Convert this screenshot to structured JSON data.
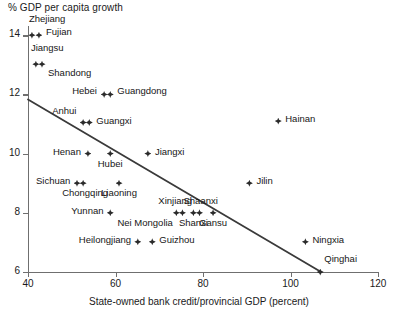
{
  "chart_data": {
    "type": "scatter",
    "title": "% GDP per capita growth",
    "ylabel": "% GDP per capita growth",
    "xlabel": "State-owned bank credit/provincial GDP (percent)",
    "xlim": [
      40,
      120
    ],
    "ylim": [
      6,
      14.4
    ],
    "xticks": [
      40,
      60,
      80,
      100,
      120
    ],
    "yticks": [
      6,
      8,
      10,
      12,
      14
    ],
    "grid": false,
    "legend": "none",
    "trend_line": {
      "x": [
        40,
        107
      ],
      "y": [
        11.83,
        6.0
      ]
    },
    "points": [
      {
        "name": "Zhejiang",
        "x": 40.9,
        "y": 14.0,
        "label_dx": -3,
        "label_dy": -17,
        "label_anchor": "left"
      },
      {
        "name": "Fujian",
        "x": 42.5,
        "y": 14.0,
        "label_dx": 7,
        "label_dy": -4,
        "label_anchor": "left"
      },
      {
        "name": "Jiangsu",
        "x": 41.8,
        "y": 13.02,
        "label_dx": -5,
        "label_dy": -17,
        "label_anchor": "left"
      },
      {
        "name": "Shandong",
        "x": 43.2,
        "y": 13.02,
        "label_dx": 6,
        "label_dy": 8,
        "label_anchor": "left"
      },
      {
        "name": "Hebei",
        "x": 57.4,
        "y": 12.0,
        "label_dx": -7,
        "label_dy": -4,
        "label_anchor": "right"
      },
      {
        "name": "Guangdong",
        "x": 58.8,
        "y": 12.0,
        "label_dx": 7,
        "label_dy": -4,
        "label_anchor": "left"
      },
      {
        "name": "Anhui",
        "x": 52.6,
        "y": 11.05,
        "label_dx": -7,
        "label_dy": -13,
        "label_anchor": "right"
      },
      {
        "name": "Guangxi",
        "x": 54.0,
        "y": 11.05,
        "label_dx": 7,
        "label_dy": -3,
        "label_anchor": "left"
      },
      {
        "name": "Hainan",
        "x": 97.2,
        "y": 11.1,
        "label_dx": 7,
        "label_dy": -3,
        "label_anchor": "left"
      },
      {
        "name": "Henan",
        "x": 53.7,
        "y": 10.0,
        "label_dx": -7,
        "label_dy": -3,
        "label_anchor": "right"
      },
      {
        "name": "Hubei",
        "x": 58.8,
        "y": 10.0,
        "label_dx": 0,
        "label_dy": 9,
        "label_anchor": "center"
      },
      {
        "name": "Jiangxi",
        "x": 67.4,
        "y": 10.0,
        "label_dx": 7,
        "label_dy": -3,
        "label_anchor": "left"
      },
      {
        "name": "Sichuan",
        "x": 51.2,
        "y": 9.0,
        "label_dx": -7,
        "label_dy": -3,
        "label_anchor": "right"
      },
      {
        "name": "Chongqing",
        "x": 52.6,
        "y": 9.0,
        "label_dx": 2,
        "label_dy": 9,
        "label_anchor": "center"
      },
      {
        "name": "Liaoning",
        "x": 60.8,
        "y": 9.0,
        "label_dx": 0,
        "label_dy": 9,
        "label_anchor": "center"
      },
      {
        "name": "Jilin",
        "x": 90.6,
        "y": 9.0,
        "label_dx": 7,
        "label_dy": -3,
        "label_anchor": "left"
      },
      {
        "name": "Yunnan",
        "x": 58.8,
        "y": 8.0,
        "label_dx": -7,
        "label_dy": -3,
        "label_anchor": "right"
      },
      {
        "name": "Xinjiang",
        "x": 73.9,
        "y": 8.0,
        "label_dx": -1,
        "label_dy": -13,
        "label_anchor": "center"
      },
      {
        "name": "Nei Mongolia",
        "x": 75.3,
        "y": 8.0,
        "label_dx": -10,
        "label_dy": 9,
        "label_anchor": "right"
      },
      {
        "name": "Shanxi",
        "x": 77.8,
        "y": 8.0,
        "label_dx": 0,
        "label_dy": 9,
        "label_anchor": "center"
      },
      {
        "name": "Shaanxi",
        "x": 79.2,
        "y": 8.0,
        "label_dx": 1,
        "label_dy": -13,
        "label_anchor": "center"
      },
      {
        "name": "Gansu",
        "x": 82.3,
        "y": 8.0,
        "label_dx": 0,
        "label_dy": 9,
        "label_anchor": "center"
      },
      {
        "name": "Heilongjiang",
        "x": 65.1,
        "y": 7.02,
        "label_dx": -7,
        "label_dy": -3,
        "label_anchor": "right"
      },
      {
        "name": "Guizhou",
        "x": 68.4,
        "y": 7.02,
        "label_dx": 7,
        "label_dy": -3,
        "label_anchor": "left"
      },
      {
        "name": "Ningxia",
        "x": 103.4,
        "y": 7.02,
        "label_dx": 7,
        "label_dy": -3,
        "label_anchor": "left"
      },
      {
        "name": "Qinghai",
        "x": 106.8,
        "y": 6.0,
        "label_dx": 4,
        "label_dy": -14,
        "label_anchor": "left"
      }
    ]
  },
  "colors": {
    "marker": "#2b2b2b",
    "axis": "#6f6f6f",
    "trend": "#3a3a3a",
    "text": "#161616",
    "background": "#ffffff"
  }
}
